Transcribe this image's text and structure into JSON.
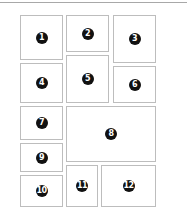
{
  "diagram": {
    "title": "",
    "boxes": [
      {
        "label": "1",
        "x": 20,
        "y": 15,
        "w": 43,
        "h": 45
      },
      {
        "label": "2",
        "x": 66,
        "y": 15,
        "w": 43,
        "h": 37
      },
      {
        "label": "3",
        "x": 113,
        "y": 15,
        "w": 43,
        "h": 48
      },
      {
        "label": "4",
        "x": 20,
        "y": 63,
        "w": 43,
        "h": 40
      },
      {
        "label": "5",
        "x": 66,
        "y": 55,
        "w": 43,
        "h": 48
      },
      {
        "label": "6",
        "x": 113,
        "y": 66,
        "w": 43,
        "h": 37
      },
      {
        "label": "7",
        "x": 20,
        "y": 106,
        "w": 43,
        "h": 34
      },
      {
        "label": "8",
        "x": 66,
        "y": 106,
        "w": 90,
        "h": 56
      },
      {
        "label": "9",
        "x": 20,
        "y": 143,
        "w": 43,
        "h": 29
      },
      {
        "label": "10",
        "x": 20,
        "y": 175,
        "w": 43,
        "h": 32
      },
      {
        "label": "11",
        "x": 66,
        "y": 165,
        "w": 32,
        "h": 42
      },
      {
        "label": "12",
        "x": 101,
        "y": 165,
        "w": 55,
        "h": 42
      }
    ],
    "colors": {
      "border": "#bdbdbd",
      "badge": "#111111",
      "badge_text": "#ffffff",
      "top_rule": "#a8a8a8"
    }
  }
}
